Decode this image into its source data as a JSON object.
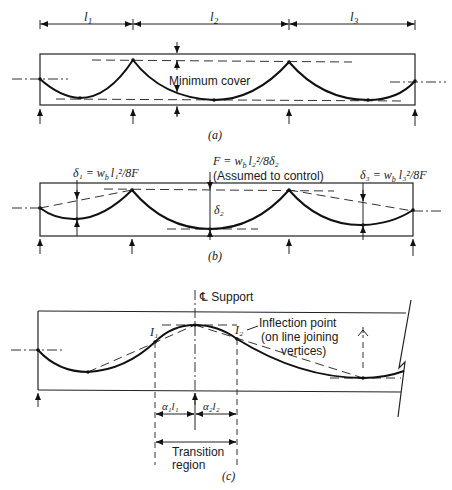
{
  "figure": {
    "panels": [
      {
        "id": "a",
        "caption": "(a)",
        "span_labels": [
          "l",
          "l",
          "l"
        ],
        "span_subscripts": [
          "1",
          "2",
          "3"
        ],
        "annotation": "Minimum cover"
      },
      {
        "id": "b",
        "caption": "(b)",
        "delta1_label": "δ₁ = w",
        "delta1_rest": "l₁²/8F",
        "force_label_line1": "F = w",
        "force_label_line1_rest": "l₂²/8δ₂",
        "force_label_line2": "(Assumed to control)",
        "delta2_label": "δ₂",
        "delta3_label": "δ₃ = w",
        "delta3_rest": "l₃²/8F",
        "sub_b": "b"
      },
      {
        "id": "c",
        "caption": "(c)",
        "support_label": "℄ Support",
        "inflection_label_line1": "Inflection point",
        "inflection_label_line2": "(on line joining",
        "inflection_label_line3": "vertices)",
        "i1_label": "I₁",
        "i2_label": "I₂",
        "alpha1_label": "α₁l₁",
        "alpha2_label": "α₂l₂",
        "transition_line1": "Transition",
        "transition_line2": "region"
      }
    ]
  }
}
